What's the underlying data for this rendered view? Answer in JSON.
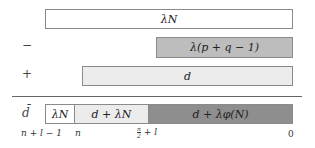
{
  "rows": [
    {
      "sign": "",
      "label": "λN"
    },
    {
      "sign": "−",
      "label": "λ(p + q − 1)"
    },
    {
      "sign": "+",
      "label": "d"
    }
  ],
  "result": {
    "sign": "d̄",
    "segments": [
      {
        "label": "λN"
      },
      {
        "label": "d + λN"
      },
      {
        "label": "d + λφ(N)"
      }
    ]
  },
  "axis_labels": {
    "a": "n + l − 1",
    "b": "n",
    "c_num": "n",
    "c_den": "2",
    "c_rest": "+ l",
    "d": "0"
  },
  "colors": {
    "white": "#ffffff",
    "light": "#ececec",
    "mid": "#bdbdbd",
    "dark": "#8e8e8e"
  }
}
